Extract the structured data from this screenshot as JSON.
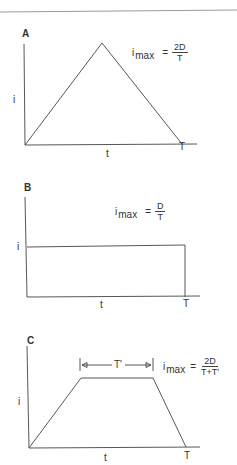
{
  "panels": [
    {
      "label": "A",
      "shape": "triangle",
      "y_label": "i",
      "x_label": "t",
      "end_label": "T",
      "equation": {
        "lhs": "i",
        "sub": "max",
        "eq": "=",
        "num": "2D",
        "den": "T"
      }
    },
    {
      "label": "B",
      "shape": "rectangle",
      "y_label": "i",
      "x_label": "t",
      "end_label": "T",
      "equation": {
        "lhs": "i",
        "sub": "max",
        "eq": "=",
        "num": "D",
        "den": "T"
      }
    },
    {
      "label": "C",
      "shape": "trapezoid",
      "y_label": "i",
      "x_label": "t",
      "end_label": "T",
      "plateau_label": "T'",
      "equation": {
        "lhs": "i",
        "sub": "max",
        "eq": "=",
        "num": "2D",
        "den": "T+T'"
      }
    }
  ],
  "colors": {
    "line": "#444444",
    "top_rule": "#9a9a9a"
  }
}
